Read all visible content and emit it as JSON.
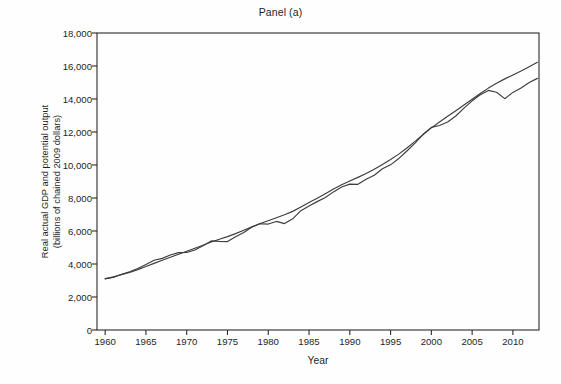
{
  "chart_data": {
    "type": "line",
    "title": "Panel (a)",
    "xlabel": "Year",
    "ylabel": "Real actual GDP and potential output\n(billions of chained 2009 dollars)",
    "xlim": [
      1959,
      2013.2
    ],
    "ylim": [
      0,
      18000
    ],
    "xticks": [
      1960,
      1965,
      1970,
      1975,
      1980,
      1985,
      1990,
      1995,
      2000,
      2005,
      2010
    ],
    "xtick_labels": [
      "1960",
      "1965",
      "1970",
      "1975",
      "1980",
      "1985",
      "1990",
      "1995",
      "2000",
      "2005",
      "2010"
    ],
    "yticks": [
      0,
      2000,
      4000,
      6000,
      8000,
      10000,
      12000,
      14000,
      16000,
      18000
    ],
    "ytick_labels": [
      "0",
      "2,000",
      "4,000",
      "6,000",
      "8,000",
      "10,000",
      "12,000",
      "14,000",
      "16,000",
      "18,000"
    ],
    "grid": false,
    "legend": "none",
    "line_color": "#3d3d3d",
    "axis_color": "#2b2b2b",
    "background_color": "#fefefe",
    "x": [
      1960,
      1961,
      1962,
      1963,
      1964,
      1965,
      1966,
      1967,
      1968,
      1969,
      1970,
      1971,
      1972,
      1973,
      1974,
      1975,
      1976,
      1977,
      1978,
      1979,
      1980,
      1981,
      1982,
      1983,
      1984,
      1985,
      1986,
      1987,
      1988,
      1989,
      1990,
      1991,
      1992,
      1993,
      1994,
      1995,
      1996,
      1997,
      1998,
      1999,
      2000,
      2001,
      2002,
      2003,
      2004,
      2005,
      2006,
      2007,
      2008,
      2009,
      2010,
      2011,
      2012,
      2013
    ],
    "series": [
      {
        "name": "Real actual GDP",
        "values": [
          3110,
          3190,
          3380,
          3530,
          3730,
          3970,
          4230,
          4340,
          4550,
          4690,
          4700,
          4850,
          5110,
          5400,
          5370,
          5360,
          5650,
          5910,
          6240,
          6440,
          6420,
          6580,
          6450,
          6740,
          7230,
          7520,
          7780,
          8030,
          8370,
          8670,
          8840,
          8830,
          9130,
          9380,
          9770,
          10010,
          10390,
          10850,
          11330,
          11860,
          12280,
          12390,
          12610,
          12970,
          13450,
          13890,
          14260,
          14520,
          14410,
          14020,
          14400,
          14670,
          15000,
          15250
        ],
        "note": "Actual real GDP; recession dips in 1970, 1974-75, 1980, 1982, 1991, 2001 and the deep 2008-2009 decline"
      },
      {
        "name": "Potential output",
        "values": [
          3100,
          3220,
          3350,
          3490,
          3660,
          3850,
          4040,
          4230,
          4410,
          4590,
          4770,
          4950,
          5140,
          5330,
          5500,
          5660,
          5840,
          6040,
          6250,
          6450,
          6620,
          6800,
          6980,
          7190,
          7450,
          7720,
          7990,
          8260,
          8540,
          8800,
          9030,
          9250,
          9480,
          9740,
          10030,
          10330,
          10660,
          11030,
          11430,
          11850,
          12250,
          12610,
          12950,
          13290,
          13640,
          13990,
          14330,
          14660,
          14960,
          15220,
          15460,
          15700,
          15960,
          16230
        ],
        "note": "CBO estimate of potential output; smooth upward trend, exceeds actual GDP after 2008"
      }
    ],
    "annotations": {
      "gap_description": "Largest actual-below-potential gap occurs 2009-2013 following the Great Recession"
    }
  },
  "figure": {
    "panel_label": "Panel (a)"
  }
}
